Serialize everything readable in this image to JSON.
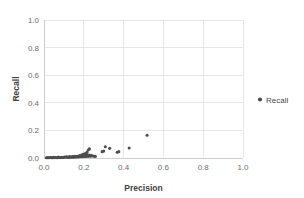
{
  "chart_data": {
    "type": "scatter",
    "title": "",
    "xlabel": "Precision",
    "ylabel": "Recall",
    "xlim": [
      0.0,
      1.0
    ],
    "ylim": [
      0.0,
      1.0
    ],
    "grid": true,
    "legend_position": "right",
    "xticks": [
      "0.0",
      "0.2",
      "0.4",
      "0.6",
      "0.8",
      "1.0"
    ],
    "xtick_values": [
      0.0,
      0.2,
      0.4,
      0.6,
      0.8,
      1.0
    ],
    "yticks": [
      "0.0",
      "0.2",
      "0.4",
      "0.6",
      "0.8",
      "1.0"
    ],
    "ytick_values": [
      0.0,
      0.2,
      0.4,
      0.6,
      0.8,
      1.0
    ],
    "marker_color": "#4d4d4d",
    "background_color": "#ffffff",
    "gridline_color": "#dcdcdc",
    "series": [
      {
        "name": "Recall",
        "marker": "circle",
        "points": [
          [
            0.012,
            0.002
          ],
          [
            0.018,
            0.003
          ],
          [
            0.024,
            0.002
          ],
          [
            0.03,
            0.004
          ],
          [
            0.036,
            0.003
          ],
          [
            0.042,
            0.002
          ],
          [
            0.048,
            0.005
          ],
          [
            0.054,
            0.003
          ],
          [
            0.06,
            0.004
          ],
          [
            0.066,
            0.002
          ],
          [
            0.072,
            0.006
          ],
          [
            0.078,
            0.004
          ],
          [
            0.084,
            0.003
          ],
          [
            0.09,
            0.005
          ],
          [
            0.096,
            0.004
          ],
          [
            0.102,
            0.007
          ],
          [
            0.108,
            0.005
          ],
          [
            0.112,
            0.009
          ],
          [
            0.118,
            0.006
          ],
          [
            0.124,
            0.004
          ],
          [
            0.128,
            0.01
          ],
          [
            0.132,
            0.007
          ],
          [
            0.138,
            0.005
          ],
          [
            0.142,
            0.011
          ],
          [
            0.146,
            0.008
          ],
          [
            0.15,
            0.006
          ],
          [
            0.154,
            0.012
          ],
          [
            0.158,
            0.009
          ],
          [
            0.162,
            0.007
          ],
          [
            0.166,
            0.013
          ],
          [
            0.17,
            0.01
          ],
          [
            0.174,
            0.008
          ],
          [
            0.178,
            0.014
          ],
          [
            0.182,
            0.011
          ],
          [
            0.186,
            0.009
          ],
          [
            0.19,
            0.016
          ],
          [
            0.194,
            0.012
          ],
          [
            0.198,
            0.01
          ],
          [
            0.202,
            0.018
          ],
          [
            0.206,
            0.013
          ],
          [
            0.21,
            0.011
          ],
          [
            0.214,
            0.02
          ],
          [
            0.218,
            0.015
          ],
          [
            0.222,
            0.012
          ],
          [
            0.226,
            0.022
          ],
          [
            0.23,
            0.016
          ],
          [
            0.234,
            0.013
          ],
          [
            0.238,
            0.019
          ],
          [
            0.205,
            0.03
          ],
          [
            0.212,
            0.034
          ],
          [
            0.216,
            0.042
          ],
          [
            0.222,
            0.058
          ],
          [
            0.228,
            0.066
          ],
          [
            0.196,
            0.026
          ],
          [
            0.188,
            0.022
          ],
          [
            0.18,
            0.018
          ],
          [
            0.246,
            0.015
          ],
          [
            0.252,
            0.013
          ],
          [
            0.258,
            0.012
          ],
          [
            0.292,
            0.046
          ],
          [
            0.3,
            0.05
          ],
          [
            0.308,
            0.082
          ],
          [
            0.33,
            0.07
          ],
          [
            0.368,
            0.042
          ],
          [
            0.376,
            0.046
          ],
          [
            0.428,
            0.072
          ],
          [
            0.518,
            0.165
          ]
        ]
      }
    ]
  },
  "legend": {
    "entries": [
      {
        "label": "Recall",
        "marker_name": "legend-marker-recall"
      }
    ]
  }
}
